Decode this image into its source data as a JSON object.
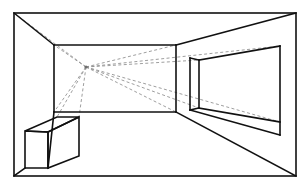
{
  "image": {
    "title": "One-point perspective interior room drawing",
    "type": "line-drawing",
    "width": 308,
    "height": 192,
    "background_color": "#ffffff",
    "line_color": "#111111",
    "construction_line_color": "#8c8c8c"
  },
  "geometry": {
    "picture_frame": {
      "label": "outer picture frame",
      "points": "14,13 296,13 296,176 14,176"
    },
    "back_wall": {
      "label": "back wall rectangle",
      "points": "54,45 176,45 176,112 54,112",
      "top_left": [
        54,
        45
      ],
      "top_right": [
        176,
        45
      ],
      "bottom_right": [
        176,
        112
      ],
      "bottom_left": [
        54,
        112
      ]
    },
    "vanishing_point": {
      "label": "vanishing point",
      "x": 86,
      "y": 67
    },
    "receding_edges": {
      "ceiling_left": "14,13 54,45",
      "ceiling_right": "296,13 176,45",
      "floor_left": "14,176 54,112",
      "floor_right": "296,176 176,112"
    },
    "window": {
      "label": "recessed window on right wall",
      "outer_opening": "190,58 280,46 280,135 190,110",
      "jamb_near_front": "190,58 190,110",
      "jamb_inner": "199,60 199,108",
      "head_line": "199,60 280,46",
      "sill_upper": "199,108 280,122",
      "sill_lower": "190,110 280,135",
      "right_edge": "280,46 280,135"
    },
    "box": {
      "label": "box / table on floor at left",
      "top_face": "25,131 57,117 79,117 48,132",
      "front_face": "25,131 48,132 48,168 25,168",
      "right_face": "48,132 79,117 79,156 48,168",
      "front_top_left": [
        25,
        131
      ],
      "front_top_right": [
        48,
        132
      ],
      "front_bottom_left": [
        25,
        168
      ],
      "front_bottom_right": [
        48,
        168
      ],
      "back_top_left": [
        57,
        117
      ],
      "back_top_right": [
        79,
        117
      ],
      "back_bottom_right": [
        79,
        156
      ]
    },
    "floor_corner_left": "14,176 25,168",
    "construction_rays": [
      {
        "name": "ray-to-back-wall-top-left",
        "from": [
          86,
          67
        ],
        "to": [
          54,
          45
        ]
      },
      {
        "name": "ray-to-back-wall-top-right",
        "from": [
          86,
          67
        ],
        "to": [
          176,
          45
        ]
      },
      {
        "name": "ray-to-back-wall-bottom-left",
        "from": [
          86,
          67
        ],
        "to": [
          54,
          112
        ]
      },
      {
        "name": "ray-to-back-wall-bottom-right",
        "from": [
          86,
          67
        ],
        "to": [
          176,
          112
        ]
      },
      {
        "name": "ray-to-picture-frame-top-left",
        "from": [
          86,
          67
        ],
        "to": [
          14,
          13
        ]
      },
      {
        "name": "ray-to-box-top-back-left",
        "from": [
          86,
          67
        ],
        "to": [
          57,
          117
        ]
      },
      {
        "name": "ray-to-box-top-back-right",
        "from": [
          86,
          67
        ],
        "to": [
          79,
          117
        ]
      },
      {
        "name": "ray-to-window-head",
        "from": [
          86,
          67
        ],
        "to": [
          199,
          60
        ]
      },
      {
        "name": "ray-to-window-sill",
        "from": [
          86,
          67
        ],
        "to": [
          199,
          108
        ]
      },
      {
        "name": "ray-to-window-upper-far",
        "from": [
          86,
          67
        ],
        "to": [
          280,
          46
        ]
      },
      {
        "name": "ray-to-window-lower-far",
        "from": [
          86,
          67
        ],
        "to": [
          280,
          122
        ]
      }
    ]
  }
}
